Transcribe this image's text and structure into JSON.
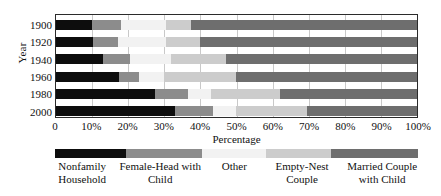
{
  "chart_data": {
    "type": "bar",
    "orientation": "horizontal",
    "stacked": true,
    "normalized": true,
    "title": "",
    "xlabel": "Percentage",
    "ylabel": "Year",
    "xlim": [
      0,
      100
    ],
    "xticks": [
      "0",
      "10%",
      "20%",
      "30%",
      "40%",
      "50%",
      "60%",
      "70%",
      "80%",
      "90%",
      "100%"
    ],
    "xtick_values": [
      0,
      10,
      20,
      30,
      40,
      50,
      60,
      70,
      80,
      90,
      100
    ],
    "grid": "vertical",
    "legend_position": "bottom",
    "categories": [
      "1900",
      "1920",
      "1940",
      "1960",
      "1980",
      "2000"
    ],
    "series": [
      {
        "name": "Nonfamily Household",
        "color": "#0d0d0d",
        "values": [
          10.0,
          10.2,
          13.0,
          17.5,
          27.5,
          33.0
        ]
      },
      {
        "name": "Female-Head with Child",
        "color": "#8c8c8c",
        "values": [
          8.0,
          7.0,
          7.5,
          5.5,
          9.0,
          10.5
        ]
      },
      {
        "name": "Other",
        "color": "#f2f2f2",
        "values": [
          12.5,
          13.3,
          11.5,
          7.0,
          6.5,
          6.5
        ]
      },
      {
        "name": "Empty-Nest Couple",
        "color": "#cccccc",
        "values": [
          7.0,
          9.5,
          15.0,
          20.0,
          19.0,
          19.5
        ]
      },
      {
        "name": "Married Couple with Child",
        "color": "#6e6e6e",
        "values": [
          62.5,
          60.0,
          53.0,
          50.0,
          38.0,
          30.5
        ]
      }
    ],
    "legend_swatch_widths": [
      19.5,
      21.0,
      17.5,
      18.0,
      24.0
    ]
  }
}
